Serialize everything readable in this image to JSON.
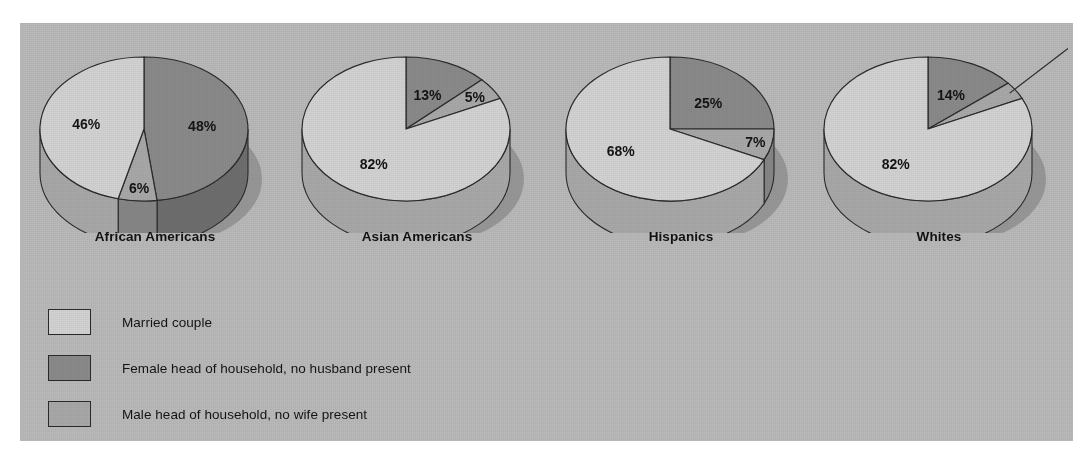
{
  "figure": {
    "panel_background": "#b9b9b9",
    "legend": {
      "items": [
        {
          "label": "Married couple",
          "color": "#d2d2d2",
          "key": "married"
        },
        {
          "label": "Female head of household, no husband present",
          "color": "#8a8a8a",
          "key": "female_head"
        },
        {
          "label": "Male head of household, no wife present",
          "color": "#a8a8a8",
          "key": "male_head"
        }
      ]
    }
  },
  "chart_data": {
    "type": "pie",
    "title": "",
    "subtitle": "",
    "xlabel": "",
    "ylabel": "",
    "legend_position": "bottom-left",
    "grid": false,
    "value_suffix": "%",
    "series_names": [
      "Married couple",
      "Female head of household, no husband present",
      "Male head of household, no wife present"
    ],
    "series_colors": [
      "#d2d2d2",
      "#8a8a8a",
      "#a8a8a8"
    ],
    "categories": [
      "African Americans",
      "Asian Americans",
      "Hispanics",
      "Whites"
    ],
    "pies": [
      {
        "label": "African Americans",
        "slices": [
          {
            "name": "Married couple",
            "value": 46,
            "display": "46%",
            "color": "#d2d2d2"
          },
          {
            "name": "Female head of household, no husband present",
            "value": 48,
            "display": "48%",
            "color": "#8a8a8a"
          },
          {
            "name": "Male head of household, no wife present",
            "value": 6,
            "display": "6%",
            "color": "#a8a8a8"
          }
        ]
      },
      {
        "label": "Asian Americans",
        "slices": [
          {
            "name": "Married couple",
            "value": 82,
            "display": "82%",
            "color": "#d2d2d2"
          },
          {
            "name": "Female head of household, no husband present",
            "value": 13,
            "display": "13%",
            "color": "#8a8a8a"
          },
          {
            "name": "Male head of household, no wife present",
            "value": 5,
            "display": "5%",
            "color": "#a8a8a8"
          }
        ]
      },
      {
        "label": "Hispanics",
        "slices": [
          {
            "name": "Married couple",
            "value": 68,
            "display": "68%",
            "color": "#d2d2d2"
          },
          {
            "name": "Female head of household, no husband present",
            "value": 25,
            "display": "25%",
            "color": "#8a8a8a"
          },
          {
            "name": "Male head of household, no wife present",
            "value": 7,
            "display": "7%",
            "color": "#a8a8a8"
          }
        ]
      },
      {
        "label": "Whites",
        "slices": [
          {
            "name": "Married couple",
            "value": 82,
            "display": "82%",
            "color": "#d2d2d2"
          },
          {
            "name": "Female head of household, no husband present",
            "value": 14,
            "display": "14%",
            "color": "#8a8a8a"
          },
          {
            "name": "Male head of household, no wife present",
            "value": 4,
            "display": "4%",
            "color": "#a8a8a8"
          }
        ]
      }
    ]
  }
}
